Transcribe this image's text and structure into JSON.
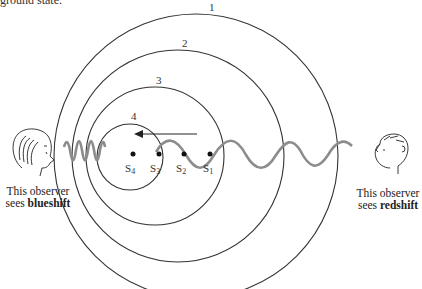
{
  "header": {
    "cropped_text": "ground state."
  },
  "diagram": {
    "wavefronts": [
      {
        "label": "1",
        "cx": 196,
        "cy": 156,
        "r": 142
      },
      {
        "label": "2",
        "cx": 178,
        "cy": 156,
        "r": 106
      },
      {
        "label": "3",
        "cx": 155,
        "cy": 156,
        "r": 69
      },
      {
        "label": "4",
        "cx": 130,
        "cy": 156,
        "r": 34
      }
    ],
    "source_positions": [
      {
        "label": "S",
        "sub": "1",
        "x": 210,
        "y": 154
      },
      {
        "label": "S",
        "sub": "2",
        "x": 184,
        "y": 154
      },
      {
        "label": "S",
        "sub": "3",
        "x": 159,
        "y": 154
      },
      {
        "label": "S",
        "sub": "4",
        "x": 133,
        "y": 154
      }
    ],
    "motion_arrow": {
      "direction": "left"
    },
    "left_observer": {
      "line1": "This observer",
      "line2_prefix": "sees ",
      "line2_bold": "blueshift"
    },
    "right_observer": {
      "line1": "This observer",
      "line2_prefix": "sees ",
      "line2_bold": "redshift"
    },
    "colors": {
      "lines": "#333333",
      "wave": "#8c8c8c"
    }
  }
}
